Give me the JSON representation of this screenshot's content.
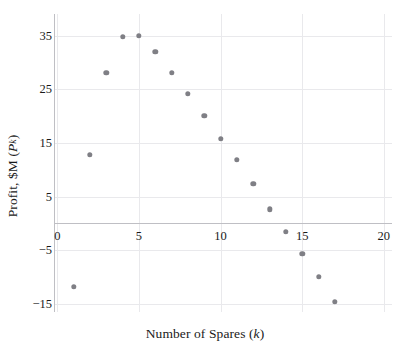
{
  "chart_data": {
    "type": "scatter",
    "title": "",
    "xlabel": "Number of Spares (k)",
    "ylabel": "Profit, $M (P_k)",
    "xlabel_parts": {
      "text": "Number of Spares (",
      "italic": "k",
      "tail": ")"
    },
    "ylabel_parts": {
      "text": "Profit, $M (",
      "italic": "P",
      "sub": "k",
      "tail": ")"
    },
    "x": [
      1,
      2,
      3,
      4,
      5,
      6,
      7,
      8,
      9,
      10,
      11,
      12,
      13,
      14,
      15,
      16,
      17
    ],
    "y": [
      -11.8,
      12.8,
      28.0,
      34.8,
      35.0,
      32.0,
      28.0,
      24.2,
      20.0,
      15.7,
      11.8,
      7.4,
      2.6,
      -1.5,
      -5.7,
      -10.0,
      -14.6
    ],
    "points": [
      {
        "k": 1,
        "p": -11.8
      },
      {
        "k": 2,
        "p": 12.8
      },
      {
        "k": 3,
        "p": 28.0
      },
      {
        "k": 4,
        "p": 34.8
      },
      {
        "k": 5,
        "p": 35.0
      },
      {
        "k": 6,
        "p": 32.0
      },
      {
        "k": 7,
        "p": 28.0
      },
      {
        "k": 8,
        "p": 24.2
      },
      {
        "k": 9,
        "p": 20.0
      },
      {
        "k": 10,
        "p": 15.7
      },
      {
        "k": 11,
        "p": 11.8
      },
      {
        "k": 12,
        "p": 7.4
      },
      {
        "k": 13,
        "p": 2.6
      },
      {
        "k": 14,
        "p": -1.5
      },
      {
        "k": 15,
        "p": -5.7
      },
      {
        "k": 16,
        "p": -10.0
      },
      {
        "k": 17,
        "p": -14.6
      }
    ],
    "xlim": [
      -0.2,
      20.5
    ],
    "ylim": [
      -16.5,
      39.0
    ],
    "xticks": [
      0,
      5,
      10,
      15,
      20
    ],
    "xtick_labels": [
      "0",
      "5",
      "10",
      "15",
      "20"
    ],
    "yticks": [
      -15,
      -5,
      5,
      15,
      25,
      35
    ],
    "ytick_labels": [
      "−15",
      "−5",
      "5",
      "15",
      "25",
      "35"
    ],
    "grid": true,
    "grid_color": "#e9e9ec",
    "legend": null,
    "marker_color": "#7f7f85",
    "marker_size": 5.4,
    "axis_color": "#bfbfc4",
    "background": "#ffffff"
  }
}
